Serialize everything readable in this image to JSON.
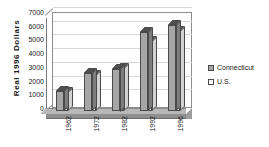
{
  "chart_data": {
    "type": "bar",
    "title": "",
    "subtitle": "",
    "xlabel": "",
    "ylabel": "Real  1996  Dollars",
    "categories": [
      "1962",
      "1972",
      "1982",
      "1992",
      "1996"
    ],
    "series": [
      {
        "name": "Connecticut",
        "color": "#a6a6a6",
        "values": [
          1450,
          2750,
          3100,
          5750,
          6300
        ]
      },
      {
        "name": "U.S.",
        "color": "#ffffff",
        "values": [
          1400,
          2600,
          3150,
          5100,
          5800
        ]
      }
    ],
    "ylim": [
      0,
      7000
    ],
    "yticks": [
      0,
      1000,
      2000,
      3000,
      4000,
      5000,
      6000,
      7000
    ],
    "ytick_labels": [
      "0",
      "1000",
      "2000",
      "3000",
      "4000",
      "5000",
      "6000",
      "7000"
    ],
    "grid": true,
    "legend_position": "right",
    "three_d": true
  },
  "legend": {
    "entries": [
      {
        "label": "Connecticut",
        "swatch": "swatch-ct"
      },
      {
        "label": "U.S.",
        "swatch": "swatch-us"
      }
    ]
  }
}
